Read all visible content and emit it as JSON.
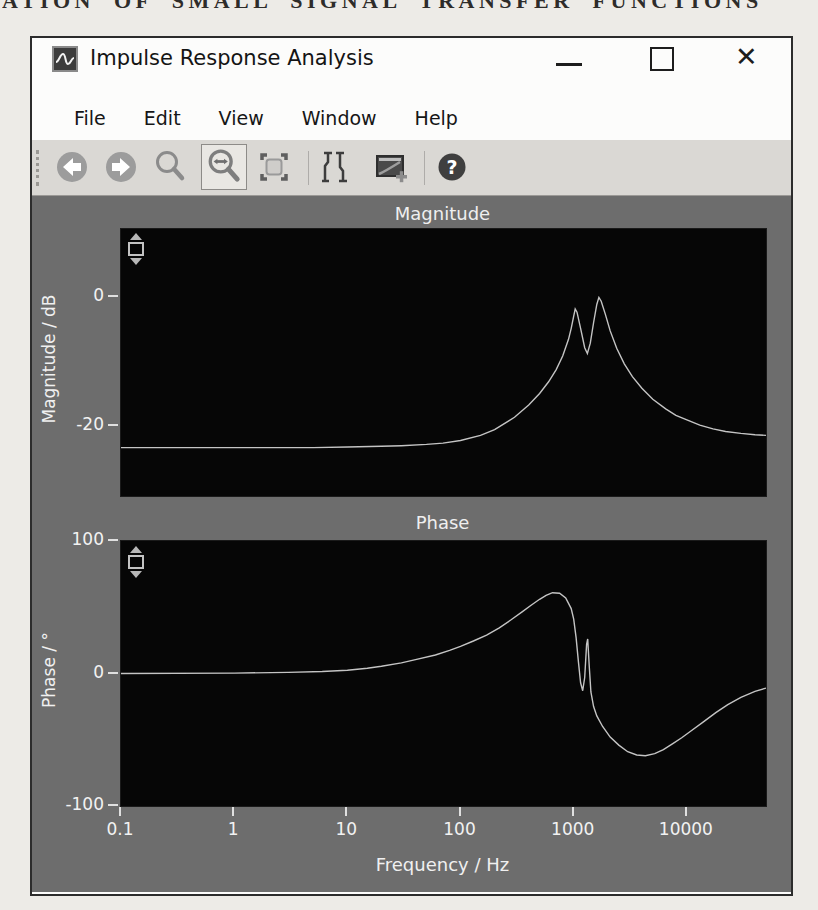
{
  "page": {
    "heading_fragment": "ATION OF SMALL SIGNAL TRANSFER FUNCTIONS"
  },
  "window": {
    "title": "Impulse Response Analysis",
    "close_glyph": "✕",
    "menu": [
      "File",
      "Edit",
      "View",
      "Window",
      "Help"
    ],
    "toolbar": {
      "tools": [
        "back",
        "forward",
        "zoom",
        "zoom-horizontal",
        "zoom-fit",
        "cursor-probe",
        "add-plot-window",
        "help"
      ],
      "selected_tool": "zoom-horizontal",
      "help_glyph": "?"
    }
  },
  "chart_data": [
    {
      "type": "line",
      "title": "Magnitude",
      "ylabel": "Magnitude / dB",
      "xlabel": "",
      "x_scale": "log",
      "xlim": [
        0.1,
        50000
      ],
      "ylim": [
        -30.9,
        10.5
      ],
      "yticks": [
        0,
        -20
      ],
      "xticks": [],
      "grid": false,
      "legend": "none",
      "points": [
        [
          0.1,
          -23.4
        ],
        [
          1,
          -23.4
        ],
        [
          5,
          -23.4
        ],
        [
          10,
          -23.3
        ],
        [
          20,
          -23.2
        ],
        [
          30,
          -23.1
        ],
        [
          50,
          -22.9
        ],
        [
          70,
          -22.7
        ],
        [
          100,
          -22.3
        ],
        [
          150,
          -21.5
        ],
        [
          200,
          -20.6
        ],
        [
          300,
          -18.7
        ],
        [
          400,
          -16.8
        ],
        [
          500,
          -15.0
        ],
        [
          600,
          -13.2
        ],
        [
          700,
          -11.3
        ],
        [
          800,
          -9.2
        ],
        [
          900,
          -6.6
        ],
        [
          950,
          -4.9
        ],
        [
          1000,
          -3.0
        ],
        [
          1030,
          -1.9
        ],
        [
          1070,
          -2.4
        ],
        [
          1150,
          -4.9
        ],
        [
          1250,
          -7.9
        ],
        [
          1320,
          -8.8
        ],
        [
          1400,
          -7.2
        ],
        [
          1500,
          -4.0
        ],
        [
          1600,
          -1.2
        ],
        [
          1670,
          -0.1
        ],
        [
          1750,
          -0.7
        ],
        [
          1900,
          -2.7
        ],
        [
          2100,
          -5.3
        ],
        [
          2400,
          -8.0
        ],
        [
          2800,
          -10.4
        ],
        [
          3300,
          -12.4
        ],
        [
          4000,
          -14.2
        ],
        [
          5000,
          -15.9
        ],
        [
          6500,
          -17.4
        ],
        [
          8000,
          -18.4
        ],
        [
          10000,
          -19.1
        ],
        [
          13000,
          -19.9
        ],
        [
          17000,
          -20.5
        ],
        [
          22000,
          -20.9
        ],
        [
          30000,
          -21.2
        ],
        [
          40000,
          -21.4
        ],
        [
          50000,
          -21.5
        ]
      ]
    },
    {
      "type": "line",
      "title": "Phase",
      "ylabel": "Phase / °",
      "xlabel": "Frequency / Hz",
      "x_scale": "log",
      "xlim": [
        0.1,
        50000
      ],
      "ylim": [
        -100,
        100
      ],
      "yticks": [
        100,
        0,
        -100
      ],
      "xticks": [
        0.1,
        1,
        10,
        100,
        1000,
        10000
      ],
      "grid": false,
      "legend": "none",
      "points": [
        [
          0.1,
          0
        ],
        [
          1,
          0.3
        ],
        [
          3,
          0.8
        ],
        [
          6,
          1.5
        ],
        [
          10,
          2.5
        ],
        [
          15,
          4
        ],
        [
          20,
          5.5
        ],
        [
          30,
          8
        ],
        [
          40,
          10.5
        ],
        [
          60,
          14
        ],
        [
          80,
          17.5
        ],
        [
          100,
          20.5
        ],
        [
          130,
          24.5
        ],
        [
          170,
          29
        ],
        [
          220,
          34.5
        ],
        [
          280,
          40.5
        ],
        [
          350,
          46.5
        ],
        [
          420,
          51.5
        ],
        [
          500,
          56
        ],
        [
          570,
          59
        ],
        [
          650,
          61
        ],
        [
          750,
          60.5
        ],
        [
          850,
          57
        ],
        [
          950,
          49
        ],
        [
          1000,
          41
        ],
        [
          1050,
          27
        ],
        [
          1100,
          9
        ],
        [
          1150,
          -7
        ],
        [
          1200,
          -13
        ],
        [
          1250,
          -3
        ],
        [
          1300,
          22
        ],
        [
          1330,
          26
        ],
        [
          1370,
          6
        ],
        [
          1420,
          -14
        ],
        [
          1500,
          -25
        ],
        [
          1600,
          -32
        ],
        [
          1800,
          -40
        ],
        [
          2100,
          -48
        ],
        [
          2500,
          -54
        ],
        [
          3000,
          -59
        ],
        [
          3600,
          -61.5
        ],
        [
          4300,
          -62
        ],
        [
          5200,
          -60.5
        ],
        [
          6200,
          -57.5
        ],
        [
          7500,
          -53
        ],
        [
          9000,
          -48.5
        ],
        [
          11000,
          -43
        ],
        [
          14000,
          -36.5
        ],
        [
          18000,
          -29.5
        ],
        [
          23000,
          -23.5
        ],
        [
          30000,
          -18
        ],
        [
          40000,
          -13.5
        ],
        [
          50000,
          -11
        ]
      ]
    }
  ]
}
